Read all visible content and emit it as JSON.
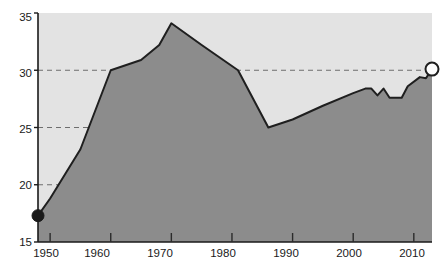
{
  "chart_data": {
    "type": "area",
    "title": "",
    "subtitle": "",
    "xlabel": "",
    "ylabel": "",
    "xlim": [
      1948,
      2013
    ],
    "ylim": [
      15,
      35
    ],
    "grid": true,
    "grid_values": [
      20,
      25,
      30
    ],
    "legend": null,
    "legend_position": "none",
    "annotations": [
      {
        "name": "start-marker",
        "style": "filled-circle",
        "x": 1948,
        "y": 17.3
      },
      {
        "name": "end-marker",
        "style": "open-circle",
        "x": 2013,
        "y": 30.1
      }
    ],
    "y_ticks": [
      15,
      20,
      25,
      30,
      35
    ],
    "y_tick_labels": [
      "15",
      "20",
      "25",
      "30",
      "35"
    ],
    "x_ticks": [
      1950,
      1960,
      1970,
      1980,
      1990,
      2000,
      2010
    ],
    "x_tick_labels": [
      "1950",
      "1960",
      "1970",
      "1980",
      "1990",
      "2000",
      "2010"
    ],
    "x": [
      1948,
      1950,
      1955,
      1960,
      1965,
      1968,
      1970,
      1975,
      1981,
      1986,
      1990,
      1995,
      2000,
      2002,
      2003,
      2004,
      2005,
      2006,
      2008,
      2009,
      2011,
      2012,
      2013
    ],
    "values": [
      17.3,
      18.8,
      23.1,
      30.0,
      30.9,
      32.2,
      34.1,
      32.2,
      30.0,
      25.0,
      25.7,
      26.9,
      28.0,
      28.4,
      28.4,
      27.8,
      28.4,
      27.6,
      27.6,
      28.6,
      29.4,
      29.3,
      30.1
    ],
    "series": [
      {
        "name": "series-1",
        "values": [
          17.3,
          18.8,
          23.1,
          30.0,
          30.9,
          32.2,
          34.1,
          32.2,
          30.0,
          25.0,
          25.7,
          26.9,
          28.0,
          28.4,
          28.4,
          27.8,
          28.4,
          27.6,
          27.6,
          28.6,
          29.4,
          29.3,
          30.1
        ]
      }
    ],
    "colors": {
      "area_fill": "#8c8c8c",
      "plot_background": "#e3e3e3",
      "line": "#1f1f1f",
      "grid": "#6e6e6e",
      "axis": "#1a1a1a",
      "start_marker": "#1a1a1a",
      "end_marker": "#ffffff"
    }
  }
}
